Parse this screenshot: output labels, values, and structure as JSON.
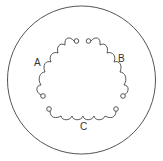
{
  "diagram": {
    "type": "three-phase coil winding (delta arrangement)",
    "colors": {
      "stroke": "#555555",
      "label": "#333333",
      "background": "#ffffff"
    },
    "coils": [
      {
        "id": "A",
        "label": "A",
        "loops": 5
      },
      {
        "id": "B",
        "label": "B",
        "loops": 5
      },
      {
        "id": "C",
        "label": "C",
        "loops": 6
      }
    ]
  }
}
